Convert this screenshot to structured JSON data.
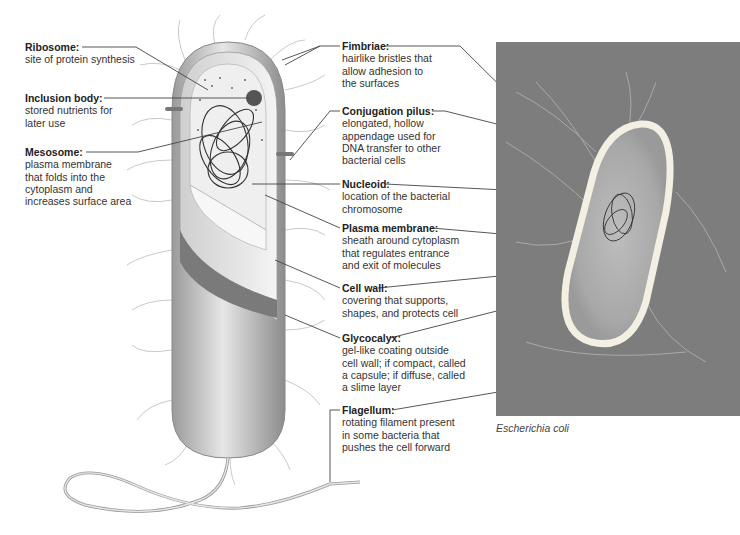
{
  "figure": {
    "drawing": "Bacterial cell (cutaway illustration)",
    "photo_caption": "Escherichia coli",
    "colors": {
      "line": "#444444",
      "photo_bg": "#7d7d7d",
      "cell_wall": "#d9d9d9",
      "cytoplasm": "#ececec"
    }
  },
  "labels_left": [
    {
      "title": "Ribosome:",
      "desc": "site of protein synthesis"
    },
    {
      "title": "Inclusion body:",
      "desc": "stored nutrients for\nlater use"
    },
    {
      "title": "Mesosome:",
      "desc": "plasma membrane\nthat folds into the\ncytoplasm and\nincreases surface area"
    }
  ],
  "labels_right": [
    {
      "title": "Fimbriae:",
      "desc": "hairlike bristles that\nallow adhesion to\nthe surfaces"
    },
    {
      "title": "Conjugation pilus:",
      "desc": "elongated, hollow\nappendage used for\nDNA transfer to other\nbacterial cells"
    },
    {
      "title": "Nucleoid:",
      "desc": "location of the bacterial\nchromosome"
    },
    {
      "title": "Plasma membrane:",
      "desc": "sheath around cytoplasm\nthat regulates entrance\nand exit of molecules"
    },
    {
      "title": "Cell wall:",
      "desc": "covering that supports,\nshapes, and protects cell"
    },
    {
      "title": "Glycocalyx:",
      "desc": "gel-like coating outside\ncell wall; if compact, called\na capsule; if diffuse, called\na slime layer"
    },
    {
      "title": "Flagellum:",
      "desc": "rotating filament present\nin some bacteria that\npushes the cell forward"
    }
  ]
}
